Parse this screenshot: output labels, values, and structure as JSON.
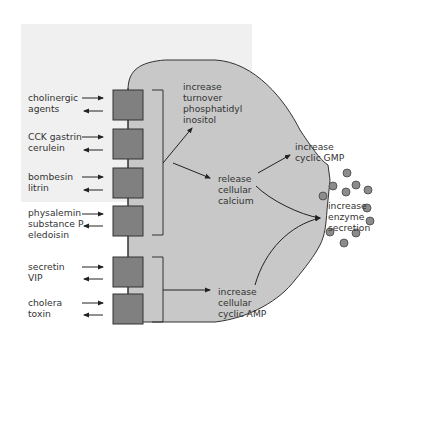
{
  "diagram": {
    "background_color": "#f0f0f0",
    "cell_color": "#c8c8c8",
    "receptor_color": "#808080",
    "granule_color": "#8c8c8c",
    "agonists": [
      {
        "label": "cholinergic\nagents",
        "line1": "cholinergic",
        "line2": "agents"
      },
      {
        "label": "CCK gastrin\ncerulein",
        "line1": "CCK gastrin",
        "line2": "cerulein"
      },
      {
        "label": "bombesin\nlitrin",
        "line1": "bombesin",
        "line2": "litrin"
      },
      {
        "label": "physalemin\nsubstance P\neledoisin",
        "line1": "physalemin",
        "line2": "substance P",
        "line3": "eledoisin"
      },
      {
        "label": "secretin\nVIP",
        "line1": "secretin",
        "line2": "VIP"
      },
      {
        "label": "cholera\ntoxin",
        "line1": "cholera",
        "line2": "toxin"
      }
    ],
    "pathways": {
      "pi_turnover": {
        "line1": "increase",
        "line2": "turnover",
        "line3": "phosphatidyl",
        "line4": "inositol"
      },
      "calcium": {
        "line1": "release",
        "line2": "cellular",
        "line3": "calcium"
      },
      "cgmp": {
        "line1": "increase",
        "line2": "cyclic GMP"
      },
      "camp": {
        "line1": "increase",
        "line2": "cellular",
        "line3": "cyclic AMP"
      },
      "secretion": {
        "line1": "increase",
        "line2": "enzyme",
        "line3": "secretion"
      }
    }
  }
}
